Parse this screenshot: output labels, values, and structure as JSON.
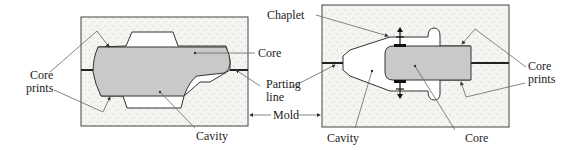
{
  "figure": {
    "left_panel": {
      "labels": {
        "core": "Core",
        "core_prints_line1": "Core",
        "core_prints_line2": "prints",
        "parting_line_1": "Parting",
        "parting_line_2": "line",
        "cavity": "Cavity"
      }
    },
    "shared": {
      "mold": "Mold"
    },
    "right_panel": {
      "labels": {
        "chaplet": "Chaplet",
        "core_prints_line1": "Core",
        "core_prints_line2": "prints",
        "cavity": "Cavity",
        "core": "Core"
      }
    },
    "colors": {
      "sand": "#f4f2ef",
      "core_fill": "#c9c9c9",
      "outline": "#333333",
      "leader": "#666666"
    }
  }
}
